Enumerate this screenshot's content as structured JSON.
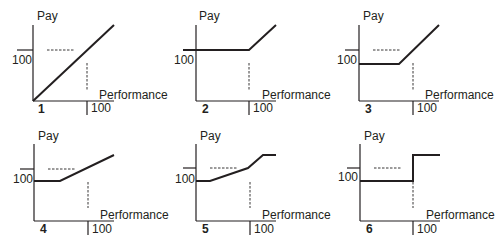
{
  "figure": {
    "y_axis_label": "Pay",
    "x_axis_label": "Performance",
    "y_reference_label": "100",
    "x_reference_label": "100",
    "panels": [
      {
        "number": "1",
        "description": "Linear pay: pay proportional to performance starting at origin"
      },
      {
        "number": "2",
        "description": "Flat pay at 100 until performance 100, then rising"
      },
      {
        "number": "3",
        "description": "Flat base pay below 100, rising steeply beyond a threshold"
      },
      {
        "number": "4",
        "description": "Flat base pay below 100, then gentle linear increase"
      },
      {
        "number": "5",
        "description": "Flat base, gentle increase, steeper increase, then capped"
      },
      {
        "number": "6",
        "description": "Flat base pay, step jump at performance 100, then flat"
      }
    ]
  },
  "colors": {
    "line": "#231f20",
    "background": "#ffffff"
  }
}
